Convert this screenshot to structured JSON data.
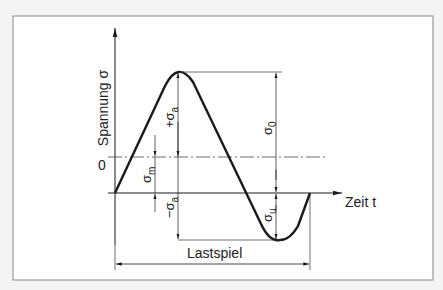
{
  "diagram": {
    "y_axis_label": "Spannung σ",
    "x_axis_label": "Zeit t",
    "zero_label": "0",
    "labels": {
      "sigma_a_plus": "+σ",
      "sigma_a_plus_sub": "a",
      "sigma_a_minus": "−σ",
      "sigma_a_minus_sub": "a",
      "sigma_m": "σ",
      "sigma_m_sub": "m",
      "sigma_o": "σ",
      "sigma_o_sub": "0",
      "sigma_u": "σ",
      "sigma_u_sub": "u",
      "load_cycle": "Lastspiel"
    },
    "colors": {
      "line": "#1a1a1a",
      "frame": "#9a9a9a",
      "background": "#ffffff"
    }
  }
}
